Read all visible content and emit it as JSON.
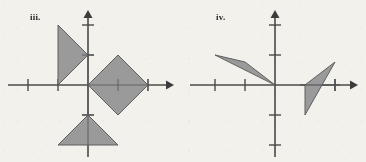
{
  "page": {
    "background_color": "#f3f1ec",
    "width": 366,
    "height": 162
  },
  "style": {
    "axis_color": "#4a4a4a",
    "tick_color": "#4a4a4a",
    "shape_fill": "#9a9a9a",
    "shape_stroke": "#5f5f5f",
    "label_color": "#2b2b2b"
  },
  "figures": [
    {
      "id": "figure-iii",
      "label": "iii.",
      "label_pos": {
        "x": 30,
        "y": 20
      },
      "origin": {
        "x": 88,
        "y": 85
      },
      "unit": 30,
      "axes": {
        "x": {
          "x1": 8,
          "x2": 172,
          "y": 85,
          "arrow": "right"
        },
        "y": {
          "y1": 12,
          "y2": 157,
          "x": 88,
          "arrow": "up"
        }
      },
      "x_ticks": [
        28,
        58,
        118,
        148
      ],
      "y_ticks": [
        25,
        55,
        115
      ],
      "shapes": [
        {
          "name": "left-triangle",
          "type": "triangle",
          "points": "58,25 58,85 88,55"
        },
        {
          "name": "center-diamond",
          "type": "quadrilateral",
          "points": "88,85 118,55 148,85 118,115"
        },
        {
          "name": "bottom-triangle",
          "type": "triangle",
          "points": "88,115 118,145 58,145"
        }
      ]
    },
    {
      "id": "figure-iv",
      "label": "iv.",
      "label_pos": {
        "x": 216,
        "y": 20
      },
      "origin": {
        "x": 275,
        "y": 85
      },
      "unit": 30,
      "axes": {
        "x": {
          "x1": 190,
          "x2": 358,
          "y": 85,
          "arrow": "right"
        },
        "y": {
          "y1": 12,
          "y2": 157,
          "x": 275,
          "arrow": "up"
        }
      },
      "x_ticks": [
        215,
        245,
        335
      ],
      "y_ticks": [
        25,
        55,
        115,
        145
      ],
      "shapes": [
        {
          "name": "upper-left-triangle",
          "type": "triangle",
          "points": "215,55 245,62 275,85"
        },
        {
          "name": "lower-right-triangle",
          "type": "triangle",
          "points": "305,85 335,62 305,115"
        }
      ]
    }
  ]
}
